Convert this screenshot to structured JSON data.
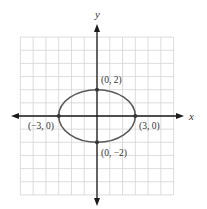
{
  "chart_data": {
    "type": "line",
    "title": "",
    "subtitle": "",
    "xlabel": "x",
    "ylabel": "y",
    "xlim": [
      -6,
      6
    ],
    "ylim": [
      -6,
      6
    ],
    "grid": true,
    "legend": null,
    "series": [
      {
        "name": "ellipse",
        "shape": "ellipse",
        "center": [
          0,
          0
        ],
        "semi_major_x": 3,
        "semi_minor_y": 2,
        "color": "#5a5a5a"
      }
    ],
    "points": [
      {
        "x": 0,
        "y": 2,
        "label": "(0, 2)"
      },
      {
        "x": -3,
        "y": 0,
        "label": "(−3, 0)"
      },
      {
        "x": 3,
        "y": 0,
        "label": "(3, 0)"
      },
      {
        "x": 0,
        "y": -2,
        "label": "(0, −2)"
      }
    ]
  },
  "axes": {
    "x_label": "x",
    "y_label": "y"
  },
  "labels": {
    "top": "(0, 2)",
    "left": "(−3, 0)",
    "right": "(3, 0)",
    "bottom": "(0, −2)"
  },
  "colors": {
    "grid": "#d4d4d4",
    "axis": "#1a1a1a",
    "curve": "#5a5a5a",
    "point": "#333333",
    "text": "#333333"
  }
}
